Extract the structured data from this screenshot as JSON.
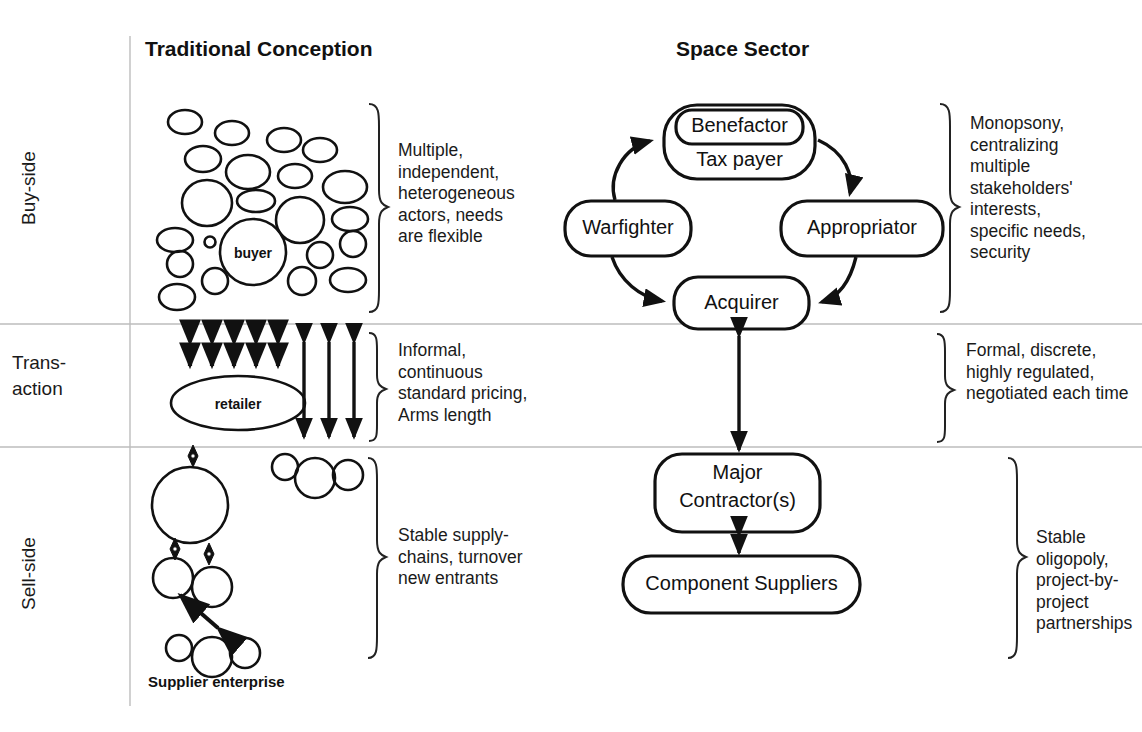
{
  "titles": {
    "left": "Traditional Conception",
    "right": "Space Sector"
  },
  "row_labels": {
    "buy": "Buy-side",
    "transaction_line1": "Trans-",
    "transaction_line2": "action",
    "sell": "Sell-side"
  },
  "left_column": {
    "buy_side": {
      "bubble_label": "buyer",
      "note": "Multiple,\nindependent,\nheterogeneous\nactors, needs\nare flexible"
    },
    "transaction": {
      "bubble_label": "retailer",
      "note": "Informal,\ncontinuous\nstandard pricing,\nArms length"
    },
    "sell_side": {
      "caption": "Supplier enterprise",
      "note": "Stable supply-\nchains, turnover\nnew entrants"
    }
  },
  "right_column": {
    "buy_side": {
      "nodes": {
        "benefactor": "Benefactor",
        "tax_payer": "Tax payer",
        "warfighter": "Warfighter",
        "appropriator": "Appropriator",
        "acquirer": "Acquirer"
      },
      "note": "Monopsony,\ncentralizing\nmultiple\nstakeholders'\ninterests,\nspecific needs,\nsecurity"
    },
    "transaction": {
      "note": "Formal, discrete,\nhighly regulated,\nnegotiated each time"
    },
    "sell_side": {
      "nodes": {
        "major_contractor_line1": "Major",
        "major_contractor_line2": "Contractor(s)",
        "component_suppliers": "Component Suppliers"
      },
      "note": "Stable oligopoly,\nproject-by-project\npartnerships"
    }
  },
  "colors": {
    "ink": "#111111",
    "divider": "#bdbdbd",
    "background": "#ffffff"
  }
}
